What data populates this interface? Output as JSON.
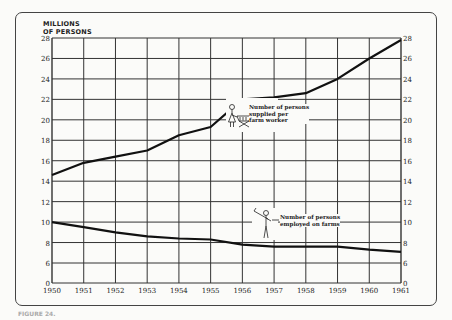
{
  "chart_data": {
    "type": "line",
    "title": "",
    "ylabel": "MILLIONS OF PERSONS",
    "xlabel": "",
    "x": [
      1950,
      1951,
      1952,
      1953,
      1954,
      1955,
      1956,
      1957,
      1958,
      1959,
      1960,
      1961
    ],
    "y_ticks_left": [
      "28",
      "26",
      "24",
      "22",
      "20",
      "18",
      "16",
      "14",
      "12",
      "10",
      "8",
      "6",
      "0"
    ],
    "y_ticks_right": [
      "28",
      "26",
      "24",
      "22",
      "20",
      "18",
      "16",
      "14",
      "12",
      "10",
      "8",
      "6",
      "0"
    ],
    "ylim": [
      0,
      28
    ],
    "axis_break": "between 0 and 6",
    "grid": true,
    "series": [
      {
        "name": "Number of persons supplied per farm worker",
        "values": [
          14.6,
          15.8,
          16.4,
          17.0,
          18.5,
          19.3,
          22.0,
          22.2,
          22.6,
          24.0,
          26.0,
          27.8
        ]
      },
      {
        "name": "Number of persons employed on farms",
        "values": [
          10.0,
          9.5,
          9.0,
          8.6,
          8.4,
          8.3,
          7.8,
          7.6,
          7.6,
          7.6,
          7.3,
          7.1
        ]
      }
    ],
    "annotations": [
      {
        "text": "Number of persons supplied per farm worker",
        "icon": "woman-with-shopping-cart-icon"
      },
      {
        "text": "Number of persons employed on farms",
        "icon": "farmer-with-hoe-icon"
      }
    ]
  },
  "ylabel_line1": "MILLIONS",
  "ylabel_line2": "OF PERSONS",
  "legend_upper": [
    "Number of persons",
    "supplied per",
    "farm worker"
  ],
  "legend_lower": [
    "Number of persons",
    "employed on farms"
  ],
  "caption": "FIGURE 24."
}
